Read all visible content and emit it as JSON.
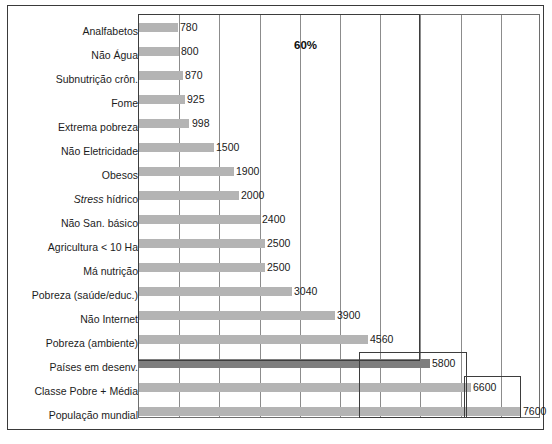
{
  "chart_data": {
    "type": "bar",
    "orientation": "horizontal",
    "title": "",
    "xlabel": "",
    "ylabel": "",
    "xlim": [
      0,
      8000
    ],
    "grid": true,
    "gridlines_x": [
      0,
      800,
      1600,
      2400,
      3200,
      4000,
      4800,
      5600,
      6400,
      7200
    ],
    "legend": "none",
    "categories": [
      "Analfabetos",
      "Não Água",
      "Subnutrição crôn.",
      "Fome",
      "Extrema pobreza",
      "Não Eletricidade",
      "Obesos",
      "Stress hídrico",
      "Não San. básico",
      "Agricultura < 10 Ha",
      "Má nutrição",
      "Pobreza (saúde/educ.)",
      "Não Internet",
      "Pobreza (ambiente)",
      "Países em desenv.",
      "Classe Pobre + Média",
      "População mundial"
    ],
    "values": [
      780,
      800,
      870,
      925,
      998,
      1500,
      1900,
      2000,
      2400,
      2500,
      2500,
      3040,
      3900,
      4560,
      5800,
      6600,
      7600
    ],
    "value_labels": [
      "780",
      "800",
      "870",
      "925",
      "998",
      "1500",
      "1900",
      "2000",
      "2400",
      "2500",
      "2500",
      "3040",
      "3900",
      "4560",
      "5800",
      "6600",
      "7600"
    ],
    "highlight_category": "Países em desenv.",
    "colors": {
      "bar": "#b4b4b4",
      "bar_highlight": "#7e7e7e",
      "gridline": "#8c8c8c",
      "axis": "#6e6e6e",
      "frame": "#3a3a3a",
      "text": "#1a1a1a"
    },
    "annotations": [
      {
        "text": "60%",
        "box": true
      },
      {
        "text": "",
        "box": true
      },
      {
        "text": "",
        "box": true
      }
    ]
  },
  "annotation": {
    "percent_label": "60%"
  }
}
